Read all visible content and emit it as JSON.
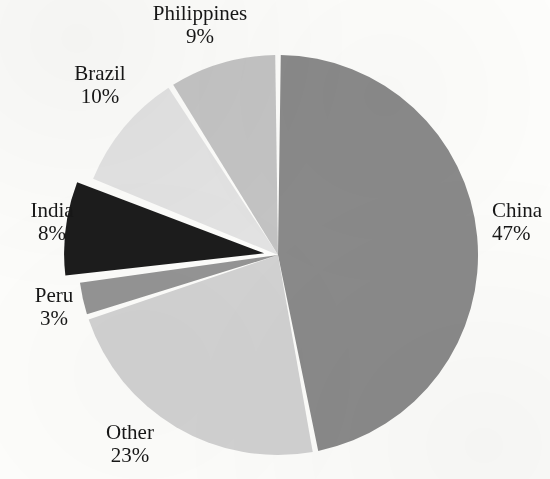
{
  "chart_data": {
    "type": "pie",
    "title": "",
    "subtitle": "",
    "xlabel": "",
    "ylabel": "",
    "legend_position": "none",
    "grid": false,
    "value_unit": "percent",
    "categories": [
      "China",
      "Other",
      "Peru",
      "India",
      "Brazil",
      "Philippines"
    ],
    "values": [
      47,
      23,
      3,
      8,
      10,
      9
    ],
    "labels": [
      "47%",
      "23%",
      "3%",
      "8%",
      "10%",
      "9%"
    ],
    "start_angle_deg": 0,
    "direction": "clockwise",
    "slices": [
      {
        "name": "China",
        "value": 47,
        "value_label": "47%",
        "color": "#8a8a8a",
        "exploded": false,
        "start_deg": 0,
        "end_deg": 169.2,
        "label_position": "right"
      },
      {
        "name": "Other",
        "value": 23,
        "value_label": "23%",
        "color": "#d2d2d2",
        "exploded": false,
        "start_deg": 169.2,
        "end_deg": 252.0,
        "label_position": "bottom-left"
      },
      {
        "name": "Peru",
        "value": 3,
        "value_label": "3%",
        "color": "#949494",
        "exploded": false,
        "start_deg": 252.0,
        "end_deg": 262.8,
        "label_position": "left"
      },
      {
        "name": "India",
        "value": 8,
        "value_label": "8%",
        "color": "#1c1c1c",
        "exploded": true,
        "start_deg": 262.8,
        "end_deg": 291.6,
        "label_position": "left"
      },
      {
        "name": "Brazil",
        "value": 10,
        "value_label": "10%",
        "color": "#e3e3e3",
        "exploded": false,
        "start_deg": 291.6,
        "end_deg": 327.6,
        "label_position": "top-left"
      },
      {
        "name": "Philippines",
        "value": 9,
        "value_label": "9%",
        "color": "#c4c4c4",
        "exploded": false,
        "start_deg": 327.6,
        "end_deg": 360.0,
        "label_position": "top"
      }
    ]
  },
  "labels": {
    "philippines": {
      "name": "Philippines",
      "value": "9%"
    },
    "brazil": {
      "name": "Brazil",
      "value": "10%"
    },
    "india": {
      "name": "India",
      "value": "8%"
    },
    "peru": {
      "name": "Peru",
      "value": "3%"
    },
    "other": {
      "name": "Other",
      "value": "23%"
    },
    "china": {
      "name": "China",
      "value": "47%"
    }
  },
  "style": {
    "background_color": "#fdfdfb",
    "text_color": "#171717",
    "separator_color": "#ffffff"
  },
  "geometry": {
    "center_x": 278,
    "center_y": 255,
    "radius": 200,
    "gap_degrees": 1.6,
    "explode_offset_px": 14
  }
}
